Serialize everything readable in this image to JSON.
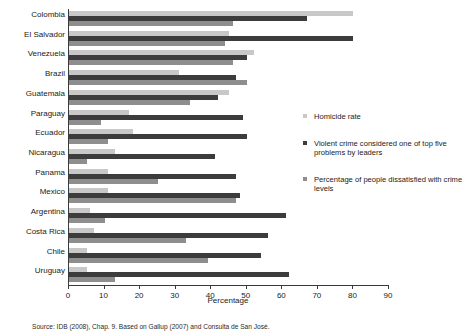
{
  "chart_data": {
    "type": "bar",
    "orientation": "horizontal",
    "title": "",
    "xlabel": "Percentage",
    "ylabel": "",
    "xlim": [
      0,
      90
    ],
    "xticks": [
      0,
      10,
      20,
      30,
      40,
      50,
      60,
      70,
      80,
      90
    ],
    "grid": false,
    "legend_position": "right",
    "categories": [
      "Colombia",
      "El Salvador",
      "Venezuela",
      "Brazil",
      "Guatemala",
      "Paraguay",
      "Ecuador",
      "Nicaragua",
      "Panama",
      "Mexico",
      "Argentina",
      "Costa Rica",
      "Chile",
      "Uruguay"
    ],
    "series": [
      {
        "name": "Homicide rate",
        "color": "#c8c8c8",
        "values": [
          80,
          45,
          52,
          31,
          45,
          17,
          18,
          13,
          11,
          11,
          6,
          7,
          5,
          5
        ]
      },
      {
        "name": "Violent crime considered one of top five problems by leaders",
        "color": "#3c3c3c",
        "values": [
          67,
          80,
          50,
          47,
          42,
          49,
          50,
          41,
          47,
          48,
          61,
          56,
          54,
          62
        ]
      },
      {
        "name": "Percentage of people dissatisfied with crime levels",
        "color": "#8e8e8e",
        "values": [
          46,
          44,
          46,
          50,
          34,
          9,
          11,
          5,
          25,
          47,
          10,
          33,
          39,
          13
        ]
      }
    ]
  },
  "legend": {
    "items": [
      {
        "label": "Homicide rate",
        "color": "#c8c8c8"
      },
      {
        "label": "Violent crime considered one of top five problems by leaders",
        "color": "#3c3c3c"
      },
      {
        "label": "Percentage of people dissatisfied with crime levels",
        "color": "#8e8e8e"
      }
    ]
  },
  "footer": {
    "source": "Source: IDB (2008), Chap. 9. Based on Gallup (2007) and Consulta de San José."
  }
}
